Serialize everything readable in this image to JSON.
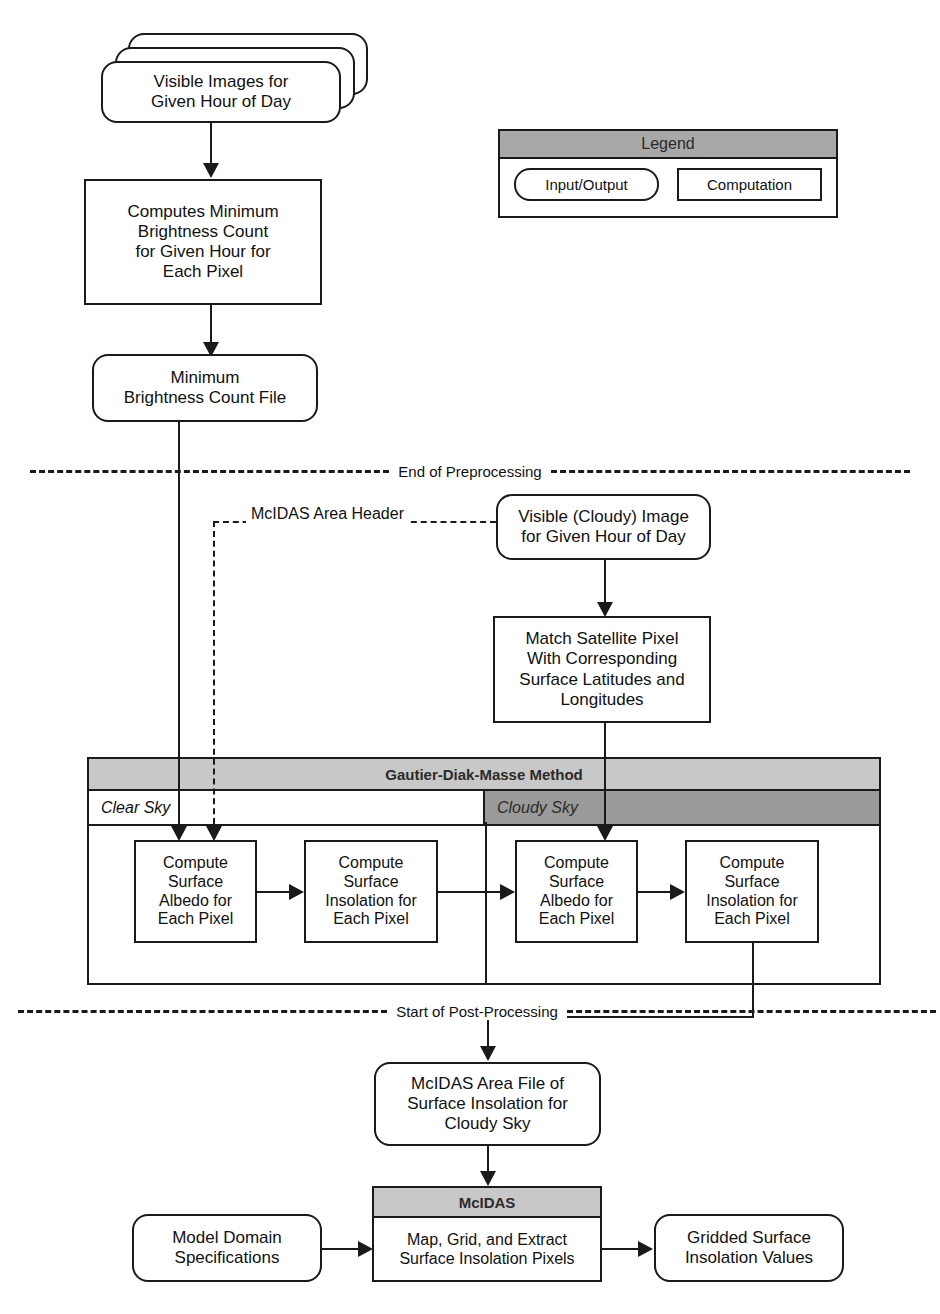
{
  "legend": {
    "title": "Legend",
    "items": [
      {
        "label": "Input/Output",
        "shape": "io"
      },
      {
        "label": "Computation",
        "shape": "proc"
      }
    ]
  },
  "nodes": {
    "visible_images": "Visible Images for\nGiven Hour of Day",
    "computes_min": "Computes Minimum\nBrightness Count\nfor Given Hour for\nEach Pixel",
    "min_file": "Minimum\nBrightness Count File",
    "visible_cloudy": "Visible (Cloudy) Image\nfor Given Hour of Day",
    "match_pixel": "Match Satellite Pixel\nWith Corresponding\nSurface Latitudes and\nLongitudes",
    "clear_albedo": "Compute\nSurface\nAlbedo for\nEach Pixel",
    "clear_insolation": "Compute\nSurface\nInsolation for\nEach Pixel",
    "cloudy_albedo": "Compute\nSurface\nAlbedo for\nEach Pixel",
    "cloudy_insolation": "Compute\nSurface\nInsolation for\nEach Pixel",
    "area_file": "McIDAS Area File of\nSurface Insolation for\nCloudy Sky",
    "model_domain": "Model Domain\nSpecifications",
    "mcidas_title": "McIDAS",
    "mcidas_body": "Map, Grid, and Extract\nSurface Insolation Pixels",
    "gridded_values": "Gridded Surface\nInsolation Values"
  },
  "gautier": {
    "title": "Gautier-Diak-Masse Method",
    "clear_sky": "Clear Sky",
    "cloudy_sky": "Cloudy Sky"
  },
  "dividers": {
    "preprocessing": "End of Preprocessing",
    "postprocessing": "Start of Post-Processing"
  },
  "edge_labels": {
    "area_header": "McIDAS Area Header"
  },
  "colors": {
    "stroke": "#1a1a1a",
    "legend_header": "#a8a8a8",
    "gautier_header": "#c8c8c8",
    "cloudy_band": "#9a9a9a",
    "clear_band": "#ffffff",
    "page": "#ffffff"
  }
}
